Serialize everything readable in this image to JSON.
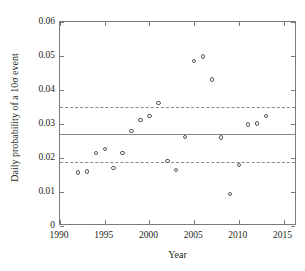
{
  "chart_data": {
    "type": "scatter",
    "title": "",
    "xlabel": "Year",
    "ylabel": "Daily probability of a 10σ event",
    "xlim": [
      1990,
      2016.5
    ],
    "ylim": [
      0,
      0.06
    ],
    "xticks": [
      1990,
      1995,
      2000,
      2005,
      2010,
      2015
    ],
    "xticklabels": [
      "1990",
      "1995",
      "2000",
      "2005",
      "2010",
      "2015"
    ],
    "yticks": [
      0,
      0.01,
      0.02,
      0.03,
      0.04,
      0.05,
      0.06
    ],
    "yticklabels": [
      "0",
      "0.01",
      "0.02",
      "0.03",
      "0.04",
      "0.05",
      "0.06"
    ],
    "grid": false,
    "legend": "none",
    "marker": "open-circle",
    "series": [
      {
        "name": "Daily probability of a 10σ event",
        "x": [
          1992,
          1993,
          1994,
          1995,
          1996,
          1997,
          1998,
          1999,
          2000,
          2001,
          2002,
          2003,
          2004,
          2005,
          2006,
          2007,
          2008,
          2009,
          2010,
          2011,
          2012,
          2013
        ],
        "y": [
          0.0157,
          0.016,
          0.0215,
          0.0227,
          0.017,
          0.0214,
          0.028,
          0.0311,
          0.0324,
          0.0362,
          0.0192,
          0.0164,
          0.0261,
          0.0485,
          0.0498,
          0.0431,
          0.026,
          0.0095,
          0.018,
          0.0299,
          0.0301,
          0.0323
        ]
      }
    ],
    "reference_lines": [
      {
        "name": "mean",
        "value": 0.027,
        "style": "solid"
      },
      {
        "name": "upper-bound",
        "value": 0.0349,
        "style": "dashed"
      },
      {
        "name": "lower-bound",
        "value": 0.0189,
        "style": "dashed"
      }
    ]
  }
}
